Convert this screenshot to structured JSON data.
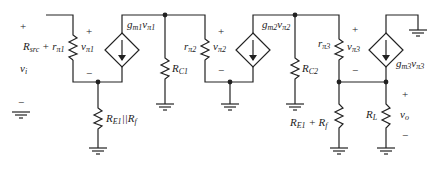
{
  "diagram": {
    "type": "small-signal equivalent circuit (three-stage amplifier)",
    "source": {
      "label": "v_i",
      "plus": "+",
      "minus": "−"
    },
    "stage1": {
      "input_resistor": {
        "label": "R_src + r_π1",
        "main": "R",
        "sub1": "src",
        "mid": " + r",
        "sub2": "π1"
      },
      "vpi": {
        "label": "v_π1",
        "main": "v",
        "sub": "π1",
        "plus": "+",
        "minus": "−"
      },
      "current_source": {
        "label": "g_m1 v_π1",
        "g": "g",
        "gsub": "m1",
        "v": "v",
        "vsub": "π1"
      },
      "emitter_resistor": {
        "label": "R_E1||R_f",
        "main": "R",
        "sub": "E1",
        "rest": "||R",
        "sub2": "f"
      },
      "collector_resistor": {
        "label": "R_C1",
        "main": "R",
        "sub": "C1"
      }
    },
    "stage2": {
      "input_resistor": {
        "label": "r_π2",
        "main": "r",
        "sub": "π2"
      },
      "vpi": {
        "label": "v_π2",
        "main": "v",
        "sub": "π2",
        "plus": "+",
        "minus": "−"
      },
      "current_source": {
        "label": "g_m2 v_π2",
        "g": "g",
        "gsub": "m2",
        "v": "v",
        "vsub": "π2"
      },
      "collector_resistor": {
        "label": "R_C2",
        "main": "R",
        "sub": "C2"
      }
    },
    "stage3": {
      "input_resistor": {
        "label": "r_π3",
        "main": "r",
        "sub": "π3"
      },
      "vpi": {
        "label": "v_π3",
        "main": "v",
        "sub": "π3",
        "plus": "+",
        "minus": "−"
      },
      "current_source": {
        "label": "g_m3 v_π3",
        "g": "g",
        "gsub": "m3",
        "v": "v",
        "vsub": "π3"
      },
      "emitter_resistor": {
        "label": "R_E1 + R_f",
        "main": "R",
        "sub": "E1",
        "rest": " + R",
        "sub2": "f"
      },
      "load_resistor": {
        "label": "R_L",
        "main": "R",
        "sub": "L"
      },
      "output": {
        "label": "v_o",
        "main": "v",
        "sub": "o",
        "plus": "+",
        "minus": "−"
      }
    }
  }
}
